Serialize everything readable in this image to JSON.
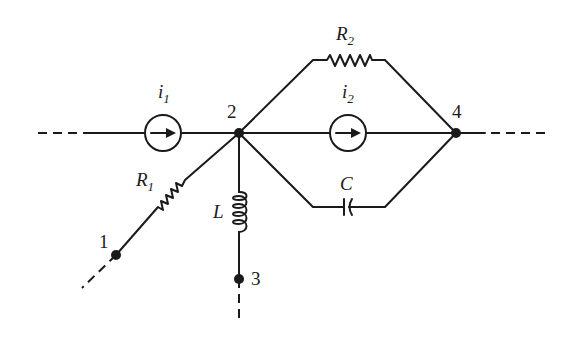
{
  "diagram": {
    "type": "circuit",
    "nodes": [
      {
        "id": "1",
        "label": "1"
      },
      {
        "id": "2",
        "label": "2"
      },
      {
        "id": "3",
        "label": "3"
      },
      {
        "id": "4",
        "label": "4"
      }
    ],
    "components": {
      "i1": {
        "symbol": "i",
        "sub": "1",
        "kind": "current-source",
        "from": "left",
        "to": "2"
      },
      "i2": {
        "symbol": "i",
        "sub": "2",
        "kind": "current-source",
        "from": "2",
        "to": "4"
      },
      "R1": {
        "symbol": "R",
        "sub": "1",
        "kind": "resistor",
        "from": "1",
        "to": "2"
      },
      "R2": {
        "symbol": "R",
        "sub": "2",
        "kind": "resistor",
        "from": "2",
        "to": "4"
      },
      "L": {
        "symbol": "L",
        "kind": "inductor",
        "from": "2",
        "to": "3"
      },
      "C": {
        "symbol": "C",
        "kind": "capacitor",
        "from": "2",
        "to": "4"
      }
    }
  }
}
